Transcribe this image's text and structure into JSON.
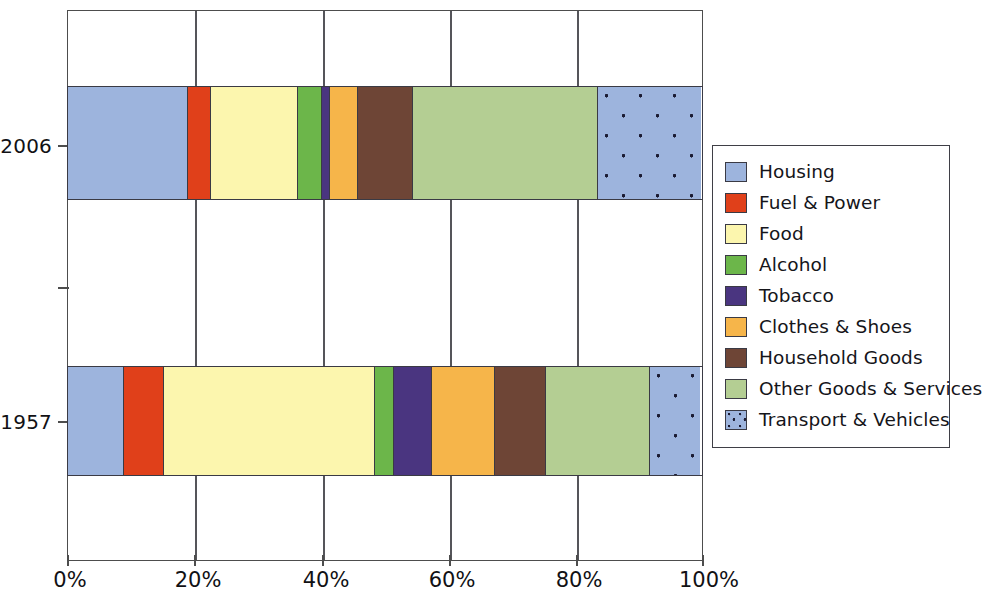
{
  "chart_data": {
    "type": "bar",
    "orientation": "horizontal",
    "stacked": true,
    "normalized": true,
    "title": "",
    "xlabel": "",
    "ylabel": "",
    "categories": [
      "2006",
      "1957"
    ],
    "xlim": [
      0,
      100
    ],
    "xticks": [
      "0%",
      "20%",
      "40%",
      "60%",
      "80%",
      "100%"
    ],
    "xtick_values": [
      0,
      20,
      40,
      60,
      80,
      100
    ],
    "grid": true,
    "legend_position": "right",
    "series": [
      {
        "name": "Housing",
        "color": "#9db4dd",
        "pattern": "solid",
        "values": [
          19.0,
          8.8
        ]
      },
      {
        "name": "Fuel & Power",
        "color": "#e0401a",
        "pattern": "solid",
        "values": [
          3.5,
          6.4
        ]
      },
      {
        "name": "Food",
        "color": "#fcf6ae",
        "pattern": "solid",
        "values": [
          13.8,
          33.2
        ]
      },
      {
        "name": "Alcohol",
        "color": "#6cb64a",
        "pattern": "solid",
        "values": [
          3.8,
          3.0
        ]
      },
      {
        "name": "Tobacco",
        "color": "#4a3580",
        "pattern": "solid",
        "values": [
          1.3,
          6.0
        ]
      },
      {
        "name": "Clothes & Shoes",
        "color": "#f6b54a",
        "pattern": "solid",
        "values": [
          4.4,
          10.0
        ]
      },
      {
        "name": "Household Goods",
        "color": "#6e4536",
        "pattern": "solid",
        "values": [
          8.6,
          8.0
        ]
      },
      {
        "name": "Other Goods & Services",
        "color": "#b4ce93",
        "pattern": "solid",
        "values": [
          29.2,
          16.4
        ]
      },
      {
        "name": "Transport & Vehicles",
        "color": "#9db4dd",
        "pattern": "dotted",
        "values": [
          16.2,
          7.9
        ]
      }
    ]
  },
  "legend": {
    "items": [
      {
        "label": "Housing"
      },
      {
        "label": "Fuel & Power"
      },
      {
        "label": "Food"
      },
      {
        "label": "Alcohol"
      },
      {
        "label": "Tobacco"
      },
      {
        "label": "Clothes & Shoes"
      },
      {
        "label": "Household Goods"
      },
      {
        "label": "Other Goods & Services"
      },
      {
        "label": "Transport & Vehicles"
      }
    ]
  },
  "axis": {
    "y_labels": [
      "2006",
      "1957"
    ],
    "x_labels": [
      "0%",
      "20%",
      "40%",
      "60%",
      "80%",
      "100%"
    ]
  }
}
